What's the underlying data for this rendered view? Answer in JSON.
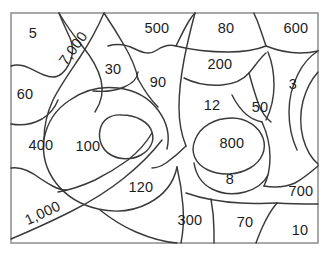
{
  "page": {
    "background_color": "#ffffff",
    "frame_color": "#8c8c8c",
    "line_color": "#3a3a3a",
    "text_color": "#1c1c1c",
    "width": 332,
    "height": 259
  },
  "frame": {
    "x": 11,
    "y": 13,
    "width": 307,
    "height": 230
  },
  "regions": [
    {
      "id": "region-5",
      "label": "5",
      "x": 33,
      "y": 34,
      "rotation": 0
    },
    {
      "id": "region-7000",
      "label": "7,000",
      "x": 74,
      "y": 49,
      "rotation": -54
    },
    {
      "id": "region-500",
      "label": "500",
      "x": 157,
      "y": 29,
      "rotation": 0
    },
    {
      "id": "region-80",
      "label": "80",
      "x": 226,
      "y": 29,
      "rotation": 0
    },
    {
      "id": "region-600",
      "label": "600",
      "x": 296,
      "y": 29,
      "rotation": 0
    },
    {
      "id": "region-30",
      "label": "30",
      "x": 113,
      "y": 70,
      "rotation": 0
    },
    {
      "id": "region-200",
      "label": "200",
      "x": 220,
      "y": 65,
      "rotation": 0
    },
    {
      "id": "region-90",
      "label": "90",
      "x": 158,
      "y": 83,
      "rotation": 0
    },
    {
      "id": "region-60",
      "label": "60",
      "x": 25,
      "y": 95,
      "rotation": 0
    },
    {
      "id": "region-3",
      "label": "3",
      "x": 293,
      "y": 85,
      "rotation": 0
    },
    {
      "id": "region-12",
      "label": "12",
      "x": 212,
      "y": 106,
      "rotation": 0
    },
    {
      "id": "region-50",
      "label": "50",
      "x": 260,
      "y": 108,
      "rotation": 0
    },
    {
      "id": "region-400",
      "label": "400",
      "x": 41,
      "y": 146,
      "rotation": 0
    },
    {
      "id": "region-100",
      "label": "100",
      "x": 88,
      "y": 147,
      "rotation": 0
    },
    {
      "id": "region-800",
      "label": "800",
      "x": 232,
      "y": 144,
      "rotation": 0
    },
    {
      "id": "region-120",
      "label": "120",
      "x": 141,
      "y": 188,
      "rotation": 0
    },
    {
      "id": "region-8",
      "label": "8",
      "x": 230,
      "y": 180,
      "rotation": 0
    },
    {
      "id": "region-700",
      "label": "700",
      "x": 301,
      "y": 192,
      "rotation": 0
    },
    {
      "id": "region-1000",
      "label": "1,000",
      "x": 43,
      "y": 214,
      "rotation": -25
    },
    {
      "id": "region-300",
      "label": "300",
      "x": 190,
      "y": 221,
      "rotation": 0
    },
    {
      "id": "region-70",
      "label": "70",
      "x": 245,
      "y": 223,
      "rotation": 0
    },
    {
      "id": "region-10",
      "label": "10",
      "x": 300,
      "y": 231,
      "rotation": 0
    }
  ]
}
